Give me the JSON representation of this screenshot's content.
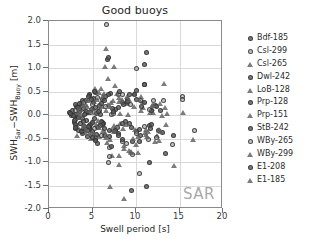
{
  "chart_data": {
    "type": "scatter",
    "title": "Good buoys",
    "xlabel": "Swell period [s]",
    "ylabel_html": "SWH<sub>Sar</sub>−SWH<sub>Buoy</sub> [m]",
    "ylabel_text": "SWH_Sar - SWH_Buoy [m]",
    "xlim": [
      0,
      20
    ],
    "ylim": [
      -2.0,
      2.0
    ],
    "xticks": [
      0,
      5,
      10,
      15,
      20
    ],
    "xtick_labels": [
      "0",
      "5",
      "10",
      "15",
      "20"
    ],
    "yticks": [
      -2.0,
      -1.5,
      -1.0,
      -0.5,
      0.0,
      0.5,
      1.0,
      1.5,
      2.0
    ],
    "ytick_labels": [
      "-2.0",
      "-1.5",
      "-1.0",
      "-0.5",
      "0.0",
      "0.5",
      "1.0",
      "1.5",
      "2.0"
    ],
    "grid": true,
    "legend_position": "right-outside",
    "annotation": "SAR",
    "marker_color": "#5a5a5a",
    "grid_color": "#d9d9d9",
    "axis_color": "#8a8a8a",
    "series": [
      {
        "name": "Bdf-185",
        "marker": "circle",
        "points": [
          [
            2.4,
            0.05
          ],
          [
            2.6,
            -0.02
          ],
          [
            2.7,
            0.1
          ],
          [
            2.9,
            -0.15
          ],
          [
            3.0,
            0.02
          ],
          [
            3.1,
            -0.28
          ],
          [
            3.2,
            0.18
          ],
          [
            3.3,
            -0.06
          ],
          [
            3.4,
            -0.34
          ],
          [
            3.5,
            0.08
          ],
          [
            3.6,
            -0.18
          ],
          [
            3.7,
            0.25
          ],
          [
            3.8,
            -0.4
          ],
          [
            3.9,
            -0.08
          ],
          [
            4.0,
            0.14
          ],
          [
            4.1,
            -0.24
          ],
          [
            4.2,
            0.3
          ],
          [
            4.3,
            -0.12
          ],
          [
            4.4,
            -0.46
          ],
          [
            4.5,
            0.06
          ],
          [
            4.6,
            -0.3
          ],
          [
            4.7,
            0.42
          ],
          [
            4.8,
            -0.2
          ],
          [
            4.9,
            0.12
          ],
          [
            5.0,
            -0.36
          ],
          [
            5.1,
            0.26
          ],
          [
            5.2,
            -0.08
          ],
          [
            5.3,
            0.48
          ],
          [
            5.4,
            -0.52
          ],
          [
            5.5,
            0.04
          ],
          [
            5.6,
            -0.26
          ],
          [
            5.8,
            0.2
          ],
          [
            6.0,
            -0.14
          ],
          [
            6.2,
            0.34
          ],
          [
            6.4,
            -0.44
          ]
        ]
      },
      {
        "name": "Csl-299",
        "marker": "circle-open",
        "points": [
          [
            3.0,
            -0.1
          ],
          [
            3.4,
            0.16
          ],
          [
            3.8,
            -0.32
          ],
          [
            4.2,
            0.04
          ],
          [
            4.6,
            -0.22
          ],
          [
            5.0,
            0.22
          ],
          [
            5.4,
            -0.48
          ],
          [
            5.8,
            0.1
          ],
          [
            6.2,
            -0.16
          ],
          [
            6.6,
            1.93
          ],
          [
            6.8,
            -1.0
          ],
          [
            7.0,
            -0.7
          ],
          [
            7.2,
            0.02
          ],
          [
            7.6,
            -0.3
          ],
          [
            8.0,
            0.44
          ],
          [
            8.4,
            -0.56
          ],
          [
            9.0,
            0.26
          ],
          [
            9.6,
            -0.84
          ],
          [
            10.0,
            1.0
          ],
          [
            10.4,
            -1.24
          ],
          [
            11.0,
            0.64
          ],
          [
            11.4,
            -0.52
          ],
          [
            12.0,
            0.3
          ],
          [
            13.2,
            0.3
          ],
          [
            14.2,
            -0.62
          ],
          [
            15.3,
            0.4
          ],
          [
            15.3,
            0.34
          ],
          [
            16.7,
            -0.32
          ]
        ]
      },
      {
        "name": "Csl-265",
        "marker": "triangle",
        "points": [
          [
            3.2,
            -0.22
          ],
          [
            3.7,
            0.12
          ],
          [
            4.1,
            -0.38
          ],
          [
            4.5,
            0.3
          ],
          [
            4.9,
            -0.14
          ],
          [
            5.3,
            0.56
          ],
          [
            5.7,
            -0.46
          ],
          [
            6.1,
            0.18
          ],
          [
            6.4,
            1.03
          ],
          [
            6.6,
            1.42
          ],
          [
            6.8,
            0.78
          ],
          [
            7.0,
            -1.52
          ],
          [
            7.2,
            -0.86
          ],
          [
            7.5,
            1.03
          ],
          [
            7.8,
            0.46
          ],
          [
            8.0,
            -1.05
          ],
          [
            8.2,
            -0.18
          ],
          [
            8.6,
            -1.78
          ],
          [
            9.0,
            0.24
          ],
          [
            9.4,
            -0.8
          ],
          [
            10.0,
            -0.62
          ],
          [
            10.6,
            0.4
          ],
          [
            11.2,
            -0.3
          ],
          [
            11.8,
            0.14
          ],
          [
            12.4,
            -0.44
          ],
          [
            13.2,
            0.68
          ],
          [
            13.4,
            -0.2
          ],
          [
            14.4,
            -1.07
          ],
          [
            15.4,
            0.06
          ],
          [
            16.6,
            -0.52
          ]
        ]
      },
      {
        "name": "Dwl-242",
        "marker": "circle",
        "points": [
          [
            2.8,
            0.0
          ],
          [
            3.1,
            -0.2
          ],
          [
            3.5,
            0.14
          ],
          [
            3.9,
            -0.34
          ],
          [
            4.3,
            0.08
          ],
          [
            4.7,
            -0.26
          ],
          [
            5.1,
            0.36
          ],
          [
            5.5,
            -0.42
          ],
          [
            5.9,
            0.02
          ],
          [
            6.3,
            -0.18
          ],
          [
            6.7,
            1.18
          ],
          [
            6.8,
            1.22
          ],
          [
            7.1,
            0.46
          ],
          [
            7.5,
            -0.36
          ],
          [
            8.0,
            0.16
          ],
          [
            8.5,
            -0.52
          ],
          [
            9.0,
            0.32
          ],
          [
            9.5,
            -0.26
          ],
          [
            10.0,
            0.52
          ],
          [
            10.5,
            -0.44
          ],
          [
            11.0,
            1.08
          ],
          [
            11.2,
            1.32
          ],
          [
            11.6,
            -0.22
          ],
          [
            12.2,
            0.2
          ],
          [
            13.0,
            -0.38
          ]
        ]
      },
      {
        "name": "LoB-128",
        "marker": "triangle",
        "points": [
          [
            3.3,
            0.06
          ],
          [
            3.8,
            -0.28
          ],
          [
            4.2,
            0.22
          ],
          [
            4.6,
            -0.4
          ],
          [
            5.0,
            0.14
          ],
          [
            5.4,
            -0.2
          ],
          [
            5.8,
            0.48
          ],
          [
            6.2,
            -0.34
          ],
          [
            6.6,
            0.1
          ],
          [
            7.0,
            -0.52
          ],
          [
            7.4,
            0.3
          ],
          [
            7.8,
            -0.24
          ],
          [
            8.2,
            0.04
          ],
          [
            8.6,
            -0.72
          ],
          [
            9.0,
            0.4
          ],
          [
            9.4,
            -0.78
          ],
          [
            9.8,
            0.18
          ],
          [
            10.2,
            -0.46
          ],
          [
            10.8,
            0.28
          ],
          [
            11.4,
            -0.36
          ],
          [
            12.0,
            0.06
          ],
          [
            12.6,
            -0.54
          ],
          [
            13.0,
            0.0
          ]
        ]
      },
      {
        "name": "Prp-128",
        "marker": "circle",
        "points": [
          [
            3.0,
            0.22
          ],
          [
            3.4,
            -0.06
          ],
          [
            3.8,
            0.3
          ],
          [
            4.2,
            -0.3
          ],
          [
            4.6,
            0.44
          ],
          [
            5.0,
            -0.16
          ],
          [
            5.2,
            0.5
          ],
          [
            5.6,
            -0.6
          ],
          [
            6.0,
            0.24
          ],
          [
            6.4,
            -0.28
          ],
          [
            6.8,
            0.44
          ],
          [
            7.2,
            -0.66
          ],
          [
            7.6,
            0.12
          ],
          [
            8.0,
            -0.4
          ],
          [
            8.4,
            0.26
          ],
          [
            8.8,
            -0.14
          ],
          [
            9.2,
            0.44
          ],
          [
            9.6,
            -0.56
          ],
          [
            10.0,
            0.34
          ],
          [
            10.4,
            -0.3
          ],
          [
            11.0,
            0.64
          ],
          [
            11.5,
            -1.01
          ],
          [
            11.8,
            -0.2
          ],
          [
            12.4,
            0.18
          ],
          [
            13.4,
            -0.82
          ]
        ]
      },
      {
        "name": "Prp-151",
        "marker": "triangle",
        "points": [
          [
            3.2,
            -0.44
          ],
          [
            3.6,
            0.04
          ],
          [
            4.0,
            -0.24
          ],
          [
            4.4,
            0.18
          ],
          [
            4.8,
            -0.5
          ],
          [
            5.2,
            0.28
          ],
          [
            5.6,
            -0.12
          ],
          [
            6.0,
            0.56
          ],
          [
            6.4,
            -0.38
          ],
          [
            6.8,
            0.22
          ],
          [
            7.2,
            -0.3
          ],
          [
            7.6,
            0.62
          ],
          [
            8.0,
            -0.86
          ],
          [
            8.4,
            0.32
          ],
          [
            8.8,
            -0.2
          ],
          [
            9.2,
            -0.76
          ],
          [
            9.8,
            0.46
          ],
          [
            10.2,
            -0.8
          ],
          [
            10.8,
            0.16
          ],
          [
            11.2,
            -0.42
          ],
          [
            11.6,
            0.06
          ],
          [
            12.2,
            -0.56
          ],
          [
            12.8,
            0.24
          ]
        ]
      },
      {
        "name": "StB-242",
        "marker": "circle",
        "points": [
          [
            2.9,
            -0.12
          ],
          [
            3.3,
            0.16
          ],
          [
            3.7,
            -0.36
          ],
          [
            4.1,
            0.02
          ],
          [
            4.5,
            -0.24
          ],
          [
            4.9,
            0.34
          ],
          [
            5.3,
            -0.54
          ],
          [
            5.7,
            0.08
          ],
          [
            6.1,
            -0.2
          ],
          [
            6.5,
            0.4
          ],
          [
            6.9,
            -0.46
          ],
          [
            7.3,
            0.14
          ],
          [
            7.7,
            -0.32
          ],
          [
            8.1,
            0.5
          ],
          [
            8.5,
            -0.18
          ],
          [
            9.0,
            0.28
          ],
          [
            9.5,
            -1.6
          ],
          [
            10.0,
            -0.36
          ],
          [
            10.6,
            0.18
          ],
          [
            11.2,
            -1.52
          ],
          [
            11.8,
            0.1
          ],
          [
            12.6,
            -0.34
          ]
        ]
      },
      {
        "name": "WBy-265",
        "marker": "circle-open",
        "points": [
          [
            3.1,
            0.1
          ],
          [
            3.6,
            -0.18
          ],
          [
            4.0,
            0.26
          ],
          [
            4.4,
            -0.34
          ],
          [
            4.8,
            0.06
          ],
          [
            5.2,
            -0.28
          ],
          [
            5.6,
            0.38
          ],
          [
            6.0,
            -0.44
          ],
          [
            6.5,
            0.18
          ],
          [
            7.0,
            -0.88
          ],
          [
            7.4,
            0.04
          ],
          [
            7.9,
            -0.26
          ],
          [
            8.4,
            0.44
          ],
          [
            8.9,
            -0.6
          ],
          [
            9.4,
            0.22
          ],
          [
            10.0,
            -0.4
          ],
          [
            10.5,
            0.3
          ],
          [
            11.0,
            -0.24
          ],
          [
            11.6,
            0.12
          ],
          [
            12.4,
            -0.48
          ]
        ]
      },
      {
        "name": "WBy-299",
        "marker": "triangle",
        "points": [
          [
            3.4,
            -0.06
          ],
          [
            3.9,
            0.2
          ],
          [
            4.3,
            -0.3
          ],
          [
            4.7,
            0.1
          ],
          [
            5.1,
            -0.42
          ],
          [
            5.5,
            0.32
          ],
          [
            5.9,
            -0.16
          ],
          [
            6.3,
            0.46
          ],
          [
            6.7,
            -0.58
          ],
          [
            7.1,
            0.26
          ],
          [
            7.5,
            -0.36
          ],
          [
            8.0,
            0.38
          ],
          [
            8.5,
            -0.28
          ],
          [
            9.1,
            0.02
          ],
          [
            9.7,
            -0.5
          ],
          [
            10.3,
            0.34
          ],
          [
            11.0,
            -0.38
          ],
          [
            11.8,
            0.2
          ],
          [
            12.6,
            -0.3
          ],
          [
            13.3,
            0.16
          ]
        ]
      },
      {
        "name": "E1-208",
        "marker": "circle",
        "points": [
          [
            2.5,
            0.04
          ],
          [
            3.0,
            -0.26
          ],
          [
            3.5,
            0.24
          ],
          [
            4.0,
            -0.14
          ],
          [
            4.5,
            0.4
          ],
          [
            5.0,
            -0.48
          ],
          [
            5.4,
            0.16
          ],
          [
            5.9,
            -0.22
          ],
          [
            6.4,
            0.3
          ],
          [
            6.9,
            -0.34
          ],
          [
            7.4,
            0.08
          ],
          [
            8.0,
            -0.44
          ],
          [
            8.6,
            0.22
          ],
          [
            9.2,
            -0.18
          ],
          [
            9.8,
            0.44
          ],
          [
            10.4,
            -0.56
          ],
          [
            11.0,
            0.26
          ],
          [
            11.7,
            -0.28
          ],
          [
            12.8,
            0.1
          ],
          [
            14.3,
            -0.44
          ]
        ]
      },
      {
        "name": "E1-185",
        "marker": "triangle",
        "points": [
          [
            3.5,
            0.14
          ],
          [
            4.0,
            -0.2
          ],
          [
            4.4,
            0.34
          ],
          [
            4.9,
            -0.38
          ],
          [
            5.3,
            0.06
          ],
          [
            5.8,
            -0.26
          ],
          [
            6.2,
            0.42
          ],
          [
            6.6,
            -0.48
          ],
          [
            7.0,
            0.18
          ],
          [
            7.5,
            -0.22
          ],
          [
            8.0,
            0.28
          ],
          [
            8.6,
            -0.64
          ],
          [
            9.2,
            0.34
          ],
          [
            9.9,
            -0.3
          ],
          [
            10.6,
            0.1
          ],
          [
            11.3,
            -0.46
          ],
          [
            12.0,
            0.22
          ],
          [
            12.9,
            -0.36
          ],
          [
            13.6,
            0.04
          ]
        ]
      }
    ]
  }
}
